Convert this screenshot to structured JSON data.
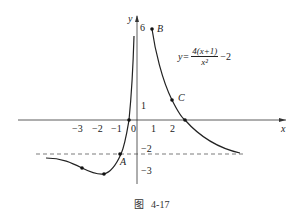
{
  "figure": {
    "caption_prefix": "图",
    "caption_number": "4-17",
    "equation": {
      "lhs": "y=",
      "numerator": "4(x+1)",
      "denominator": "x²",
      "suffix": "−2"
    },
    "axes": {
      "x_label": "x",
      "y_label": "y",
      "origin_label": "0"
    },
    "x_ticks": [
      "−3",
      "−2",
      "−1",
      "1",
      "2"
    ],
    "y_ticks": [
      "6",
      "1",
      "−2",
      "−3"
    ],
    "points": {
      "A": "A",
      "B": "B",
      "C": "C"
    },
    "asymptote": "y = −2 (dashed)"
  }
}
